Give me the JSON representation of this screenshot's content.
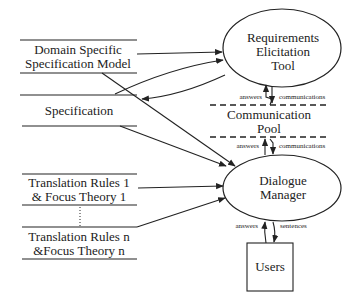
{
  "diagram": {
    "data_stores": [
      {
        "id": "domain",
        "lines": [
          "Domain Specific",
          "Specification Model"
        ]
      },
      {
        "id": "spec",
        "lines": [
          "Specification"
        ]
      },
      {
        "id": "tr1",
        "lines": [
          "Translation Rules 1",
          "& Focus Theory 1"
        ]
      },
      {
        "id": "trn",
        "lines": [
          "Translation Rules n",
          "&Focus Theory n"
        ]
      }
    ],
    "processes": [
      {
        "id": "ret",
        "lines": [
          "Requirements",
          "Elicitation",
          "Tool"
        ]
      },
      {
        "id": "dm",
        "lines": [
          "Dialogue",
          "Manager"
        ]
      }
    ],
    "pool": {
      "lines": [
        "Communication",
        "Pool"
      ]
    },
    "entity": {
      "label": "Users"
    },
    "flow_labels": {
      "ret_pool_up": "answers",
      "ret_pool_down": "communications",
      "pool_dm_up": "answers",
      "pool_dm_down": "communications",
      "users_up": "answers",
      "users_down": "sentences"
    },
    "colors": {
      "stroke": "#222222",
      "background": "#ffffff"
    }
  }
}
